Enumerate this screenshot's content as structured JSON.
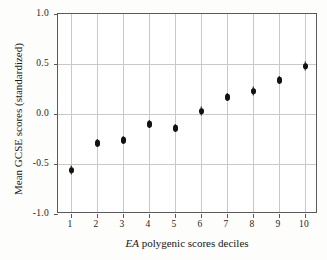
{
  "chart_data": {
    "type": "scatter",
    "title": "",
    "xlabel_parts": {
      "italic": "EA",
      "rest": " polygenic scores deciles"
    },
    "xlabel": "EA polygenic scores deciles",
    "ylabel": "Mean GCSE scores (standardized)",
    "categories": [
      "1",
      "2",
      "3",
      "4",
      "5",
      "6",
      "7",
      "8",
      "9",
      "10"
    ],
    "x": [
      1,
      2,
      3,
      4,
      5,
      6,
      7,
      8,
      9,
      10
    ],
    "values": [
      -0.56,
      -0.29,
      -0.26,
      -0.1,
      -0.14,
      0.03,
      0.17,
      0.23,
      0.34,
      0.48
    ],
    "errors": [
      0.045,
      0.04,
      0.04,
      0.04,
      0.04,
      0.045,
      0.04,
      0.045,
      0.04,
      0.045
    ],
    "xticklabels": [
      "1",
      "2",
      "3",
      "4",
      "5",
      "6",
      "7",
      "8",
      "9",
      "10"
    ],
    "yticklabels": [
      "1.0",
      "0.5",
      "0.0",
      "-0.5",
      "-1.0"
    ],
    "ytickvalues": [
      1.0,
      0.5,
      0.0,
      -0.5,
      -1.0
    ],
    "ylim": [
      -1.0,
      1.0
    ],
    "xlim": [
      0.5,
      10.5
    ],
    "grid": "horizontal-and-vertical",
    "legend": "none",
    "marker_color": "#121214",
    "grid_color": "#c9c9c6",
    "frame_color": "#5a5a5a",
    "background_color": "#ffffff"
  }
}
